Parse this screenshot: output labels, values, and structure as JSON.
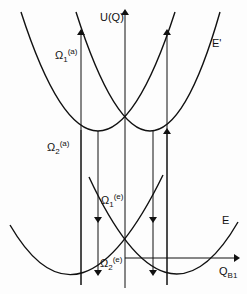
{
  "diagram": {
    "axis_y_label": "U(Q)",
    "axis_x_label": "Q",
    "axis_x_sub": "B1",
    "upper_curve_label": "E'",
    "lower_curve_label": "E",
    "transitions": {
      "omega1_a": {
        "base": "Ω",
        "sub": "1",
        "sup": "(a)"
      },
      "omega2_a": {
        "base": "Ω",
        "sub": "2",
        "sup": "(a)"
      },
      "omega1_e": {
        "base": "Ω",
        "sub": "1",
        "sup": "(e)"
      },
      "omega2_e": {
        "base": "Ω",
        "sub": "2",
        "sup": "(e)"
      }
    },
    "line_color": "#111111"
  }
}
